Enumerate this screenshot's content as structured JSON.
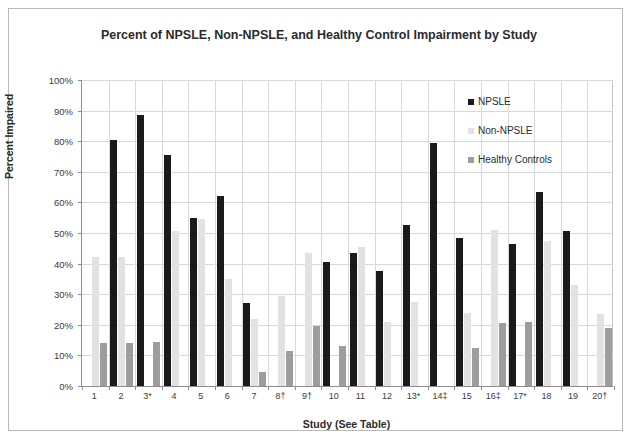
{
  "chart_data": {
    "type": "bar",
    "title": "Percent of NPSLE, Non-NPSLE, and Healthy Control Impairment by Study",
    "xlabel": "Study (See Table)",
    "ylabel": "Percent Impaired",
    "ylim": [
      0,
      100
    ],
    "ytick_labels": [
      "0%",
      "10%",
      "20%",
      "30%",
      "40%",
      "50%",
      "60%",
      "70%",
      "80%",
      "90%",
      "100%"
    ],
    "ytick_values": [
      0,
      10,
      20,
      30,
      40,
      50,
      60,
      70,
      80,
      90,
      100
    ],
    "grid": true,
    "legend_position": "inside-top-right",
    "categories": [
      "1",
      "2",
      "3*",
      "4",
      "5",
      "6",
      "7",
      "8†",
      "9†",
      "10",
      "11",
      "12",
      "13*",
      "14‡",
      "15",
      "16‡",
      "17*",
      "18",
      "19",
      "20†"
    ],
    "series": [
      {
        "name": "NPSLE",
        "color": "#1a1a1a",
        "values": [
          null,
          80.5,
          88.5,
          75.5,
          55.0,
          62.0,
          27.0,
          null,
          null,
          40.5,
          43.5,
          37.5,
          52.5,
          79.5,
          48.5,
          null,
          46.5,
          63.5,
          50.5,
          null
        ]
      },
      {
        "name": "Non-NPSLE",
        "color": "#e2e2e2",
        "values": [
          42.0,
          42.0,
          null,
          50.5,
          54.5,
          35.0,
          22.0,
          29.5,
          43.5,
          null,
          45.5,
          21.0,
          27.5,
          null,
          24.0,
          51.0,
          null,
          47.5,
          33.0,
          23.5
        ]
      },
      {
        "name": "Healthy Controls",
        "color": "#9d9d9d",
        "values": [
          14.0,
          14.0,
          14.5,
          null,
          null,
          null,
          4.5,
          11.5,
          19.5,
          13.0,
          null,
          null,
          null,
          null,
          12.5,
          20.5,
          21.0,
          null,
          null,
          19.0
        ]
      }
    ]
  },
  "legend": {
    "items": [
      {
        "label": "NPSLE",
        "swatch": "legend-swatch-npsle"
      },
      {
        "label": "Non-NPSLE",
        "swatch": "legend-swatch-non-npsle"
      },
      {
        "label": "Healthy Controls",
        "swatch": "legend-swatch-healthy-controls"
      }
    ]
  }
}
